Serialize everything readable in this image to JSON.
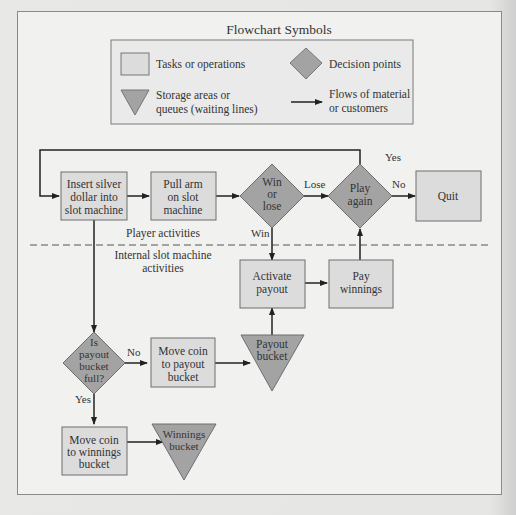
{
  "legend": {
    "title": "Flowchart Symbols",
    "items": [
      {
        "symbol": "rectangle",
        "label": "Tasks or operations"
      },
      {
        "symbol": "diamond",
        "label": "Decision points"
      },
      {
        "symbol": "triangle",
        "label_lines": [
          "Storage areas or",
          "queues (waiting lines)"
        ]
      },
      {
        "symbol": "arrow",
        "label_lines": [
          "Flows of material",
          "or customers"
        ]
      }
    ]
  },
  "regions": {
    "player": "Player activities",
    "internal_lines": [
      "Internal slot machine",
      "activities"
    ]
  },
  "nodes": {
    "insert": {
      "type": "task",
      "lines": [
        "Insert silver",
        "dollar into",
        "slot machine"
      ]
    },
    "pull": {
      "type": "task",
      "lines": [
        "Pull arm",
        "on slot",
        "machine"
      ]
    },
    "winlose": {
      "type": "decision",
      "lines": [
        "Win",
        "or",
        "lose"
      ]
    },
    "playagain": {
      "type": "decision",
      "lines": [
        "Play",
        "again"
      ]
    },
    "quit": {
      "type": "task",
      "lines": [
        "Quit"
      ]
    },
    "activate": {
      "type": "task",
      "lines": [
        "Activate",
        "payout"
      ]
    },
    "pay": {
      "type": "task",
      "lines": [
        "Pay",
        "winnings"
      ]
    },
    "full": {
      "type": "decision",
      "lines": [
        "Is",
        "payout",
        "bucket",
        "full?"
      ]
    },
    "movepayout": {
      "type": "task",
      "lines": [
        "Move coin",
        "to payout",
        "bucket"
      ]
    },
    "payoutbucket": {
      "type": "storage",
      "lines": [
        "Payout",
        "bucket"
      ]
    },
    "movewinnings": {
      "type": "task",
      "lines": [
        "Move coin",
        "to winnings",
        "bucket"
      ]
    },
    "winningsbucket": {
      "type": "storage",
      "lines": [
        "Winnings",
        "bucket"
      ]
    }
  },
  "edge_labels": {
    "lose": "Lose",
    "win": "Win",
    "yes_play": "Yes",
    "no_quit": "No",
    "no_full": "No",
    "yes_full": "Yes"
  },
  "colors": {
    "task_fill": "#dcdcdc",
    "shape_fill": "#a3a3a3",
    "stroke": "#6f6f6f",
    "line": "#222222"
  }
}
